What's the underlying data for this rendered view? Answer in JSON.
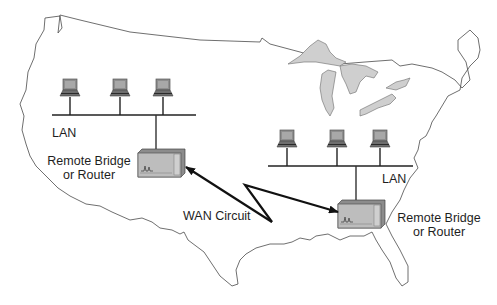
{
  "diagram": {
    "type": "network-topology",
    "background": "US map outline",
    "colors": {
      "map_outline": "#4a4a4a",
      "lakes_fill": "#cfcfcf",
      "device_body": "#a9a9a9",
      "device_front": "#c4c4c4",
      "line": "#222222"
    },
    "sites": [
      {
        "id": "west",
        "lan_label": "LAN",
        "router_label_line1": "Remote Bridge",
        "router_label_line2": "or Router",
        "computers": 3
      },
      {
        "id": "east",
        "lan_label": "LAN",
        "router_label_line1": "Remote Bridge",
        "router_label_line2": "or Router",
        "computers": 3
      }
    ],
    "link": {
      "label": "WAN Circuit",
      "style": "lightning-bolt double-arrow"
    }
  }
}
